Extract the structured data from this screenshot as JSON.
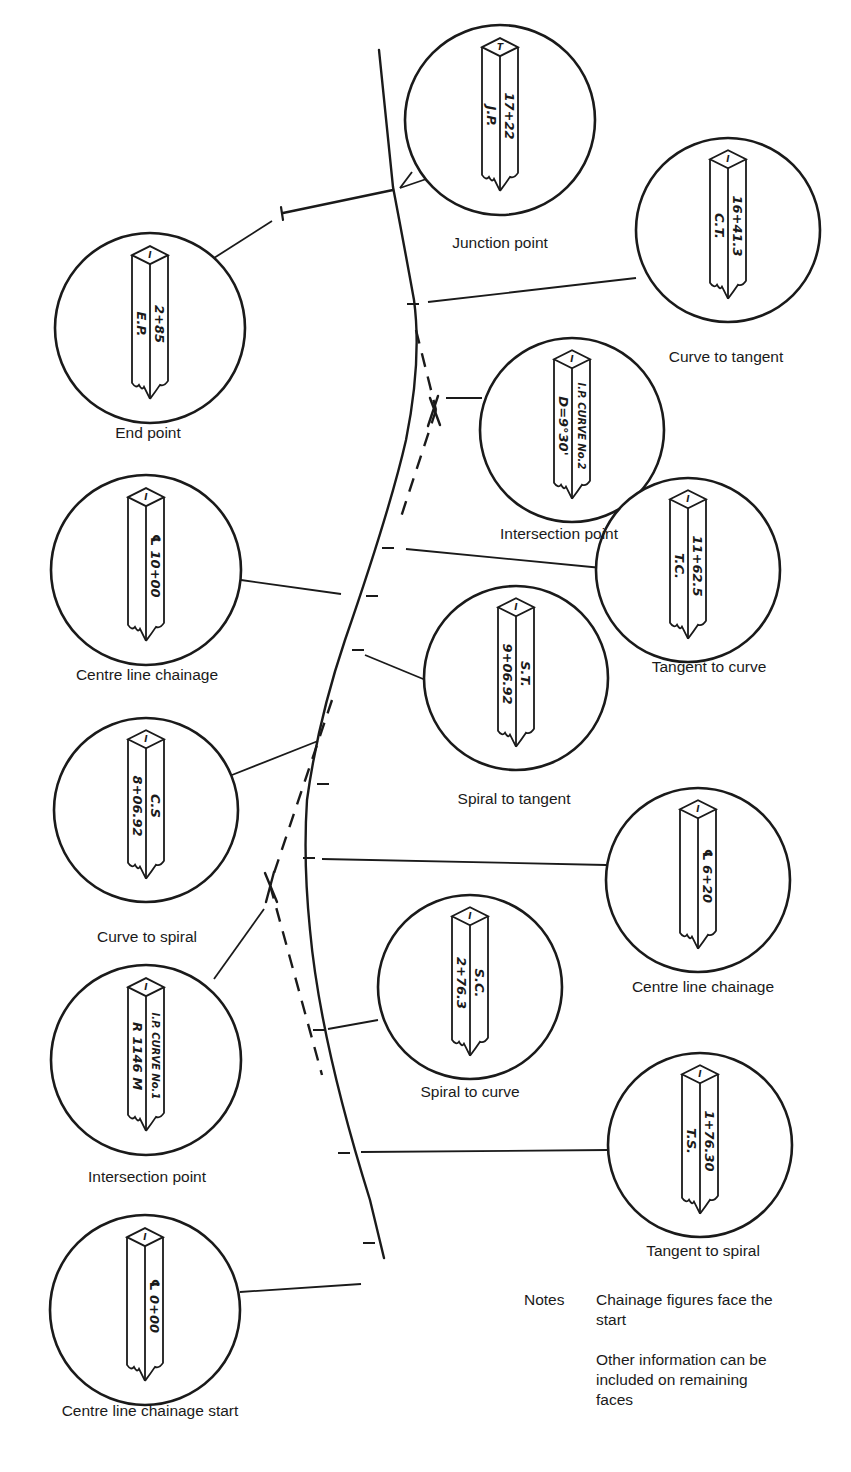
{
  "figure": {
    "stroke_color": "#1a1a1a",
    "background": "#ffffff"
  },
  "stakes": [
    {
      "id": "junction-point",
      "label": "Junction point",
      "face_left": "J.P.",
      "face_right": "17+22",
      "top_mark": "T",
      "circle": {
        "cx": 500,
        "cy": 120,
        "r": 95
      },
      "label_pos": {
        "x": 500,
        "y": 244
      }
    },
    {
      "id": "curve-to-tangent",
      "label": "Curve to tangent",
      "face_left": "C.T.",
      "face_right": "16+41.3",
      "top_mark": "I",
      "circle": {
        "cx": 728,
        "cy": 230,
        "r": 92
      },
      "label_pos": {
        "x": 726,
        "y": 358
      }
    },
    {
      "id": "end-point",
      "label": "End point",
      "face_left": "E.P.",
      "face_right": "2+85",
      "top_mark": "I",
      "circle": {
        "cx": 150,
        "cy": 328,
        "r": 95
      },
      "label_pos": {
        "x": 148,
        "y": 434
      }
    },
    {
      "id": "intersection-point-2",
      "label": "Intersection point",
      "face_left": "D=9°30'",
      "face_right": "I.P. CURVE No.2",
      "top_mark": "I",
      "circle": {
        "cx": 572,
        "cy": 430,
        "r": 92
      },
      "label_pos": {
        "x": 559,
        "y": 535
      }
    },
    {
      "id": "centre-line-chainage-10",
      "label": "Centre line chainage",
      "face_left": "",
      "face_right": "℄ 10+00",
      "top_mark": "I",
      "circle": {
        "cx": 146,
        "cy": 570,
        "r": 95
      },
      "label_pos": {
        "x": 147,
        "y": 676
      }
    },
    {
      "id": "tangent-to-curve",
      "label": "Tangent to curve",
      "face_left": "T.C.",
      "face_right": "11+62.5",
      "top_mark": "I",
      "circle": {
        "cx": 688,
        "cy": 570,
        "r": 92
      },
      "label_pos": {
        "x": 709,
        "y": 668
      }
    },
    {
      "id": "spiral-to-tangent",
      "label": "Spiral to tangent",
      "face_left": "9+06.92",
      "face_right": "S.T.",
      "top_mark": "I",
      "circle": {
        "cx": 516,
        "cy": 678,
        "r": 92
      },
      "label_pos": {
        "x": 514,
        "y": 800
      }
    },
    {
      "id": "curve-to-spiral",
      "label": "Curve to spiral",
      "face_left": "8+06.92",
      "face_right": "C.S",
      "top_mark": "I",
      "circle": {
        "cx": 146,
        "cy": 810,
        "r": 92
      },
      "label_pos": {
        "x": 147,
        "y": 938
      }
    },
    {
      "id": "centre-line-chainage-6",
      "label": "Centre line chainage",
      "face_left": "",
      "face_right": "℄ 6+20",
      "top_mark": "I",
      "circle": {
        "cx": 698,
        "cy": 880,
        "r": 92
      },
      "label_pos": {
        "x": 703,
        "y": 988
      }
    },
    {
      "id": "spiral-to-curve",
      "label": "Spiral to curve",
      "face_left": "2+76.3",
      "face_right": "S.C.",
      "top_mark": "I",
      "circle": {
        "cx": 470,
        "cy": 987,
        "r": 92
      },
      "label_pos": {
        "x": 470,
        "y": 1093
      }
    },
    {
      "id": "intersection-point-1",
      "label": "Intersection point",
      "face_left": "R 1146 M",
      "face_right": "I.P. CURVE No.1",
      "top_mark": "I",
      "circle": {
        "cx": 146,
        "cy": 1060,
        "r": 95
      },
      "label_pos": {
        "x": 147,
        "y": 1178
      }
    },
    {
      "id": "tangent-to-spiral",
      "label": "Tangent to spiral",
      "face_left": "T.S.",
      "face_right": "1+76.30",
      "top_mark": "I",
      "circle": {
        "cx": 700,
        "cy": 1145,
        "r": 92
      },
      "label_pos": {
        "x": 703,
        "y": 1252
      }
    },
    {
      "id": "centre-line-chainage-start",
      "label": "Centre line chainage start",
      "face_left": "",
      "face_right": "℄ 0+00",
      "top_mark": "I",
      "circle": {
        "cx": 145,
        "cy": 1310,
        "r": 95
      },
      "label_pos": {
        "x": 150,
        "y": 1412
      }
    }
  ],
  "notes": {
    "title": "Notes",
    "lines": [
      "Chainage figures face the start",
      "Other information can be included on remaining faces"
    ]
  }
}
